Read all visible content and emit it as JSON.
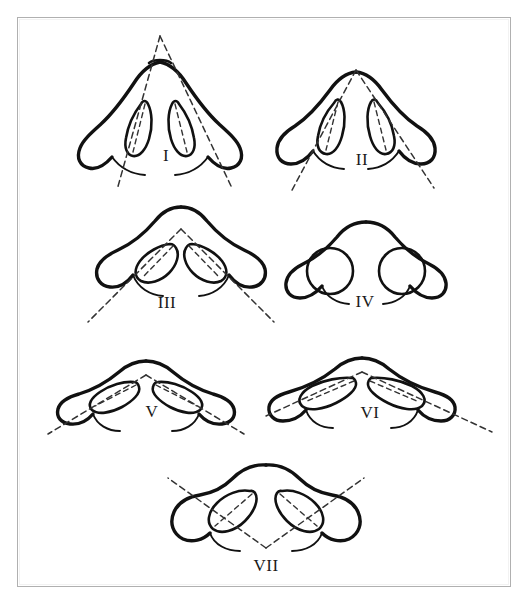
{
  "plate": {
    "title": "Nostril shape classification plate",
    "description": "Seven schematic basal views of the nose showing nostril (naris) outline types with dashed long-axis orientation lines",
    "background_color": "#ffffff",
    "frame_color": "#b0b0b0",
    "ink_color": "#111111",
    "dash_color": "#333333",
    "figure_count": 7
  },
  "figures": [
    {
      "id": "fig-1",
      "label": "I",
      "label_x": 166,
      "label_y": 156,
      "axis_lines": true,
      "nostril_shape": "narrow-slit",
      "apex_angle_deg": 35,
      "tip": "very-pointed"
    },
    {
      "id": "fig-2",
      "label": "II",
      "label_x": 362,
      "label_y": 160,
      "axis_lines": true,
      "nostril_shape": "narrow-slit",
      "apex_angle_deg": 55,
      "tip": "pointed"
    },
    {
      "id": "fig-3",
      "label": "III",
      "label_x": 167,
      "label_y": 303,
      "axis_lines": true,
      "nostril_shape": "oblique-oval",
      "apex_angle_deg": 80,
      "tip": "rounded"
    },
    {
      "id": "fig-4",
      "label": "IV",
      "label_x": 365,
      "label_y": 302,
      "axis_lines": false,
      "nostril_shape": "circular",
      "apex_angle_deg": null,
      "tip": "broad-rounded"
    },
    {
      "id": "fig-5",
      "label": "V",
      "label_x": 152,
      "label_y": 412,
      "axis_lines": true,
      "nostril_shape": "elongated-oblique",
      "apex_angle_deg": 105,
      "tip": "broad"
    },
    {
      "id": "fig-6",
      "label": "VI",
      "label_x": 370,
      "label_y": 413,
      "axis_lines": true,
      "nostril_shape": "elongated-oblique",
      "apex_angle_deg": 130,
      "tip": "broad-flat"
    },
    {
      "id": "fig-7",
      "label": "VII",
      "label_x": 266,
      "label_y": 566,
      "axis_lines": true,
      "nostril_shape": "long-oblique-oval",
      "apex_angle_deg": 90,
      "tip": "wide-flat"
    }
  ]
}
